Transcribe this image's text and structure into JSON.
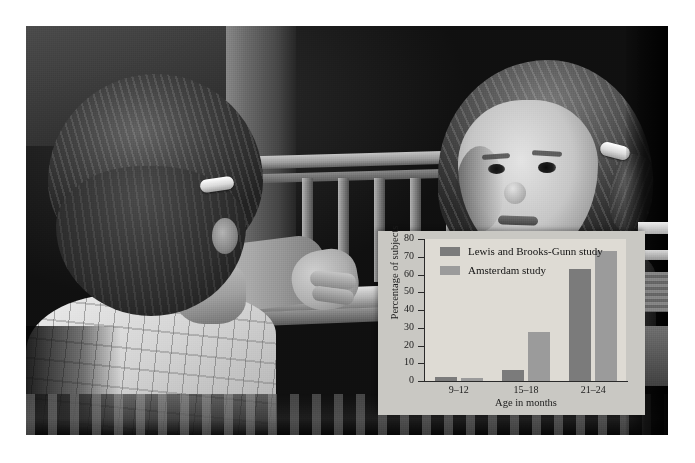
{
  "figure": {
    "background_color": "#ffffff",
    "photo": {
      "description": "black-and-white photograph of a toddler at a crib rail looking at her mirror reflection",
      "subjects": [
        {
          "name": "child-left",
          "detail": "back of head with white barrette, patterned sleeper, arm reaching toward mirror"
        },
        {
          "name": "child-right",
          "detail": "mirror reflection of toddler's face, ponytail with white barrette"
        }
      ]
    }
  },
  "chart_panel": {
    "panel_color": "#c9c8c3",
    "plot_color": "#dedbd4"
  },
  "chart_data": {
    "type": "bar",
    "title": "",
    "xlabel": "Age in months",
    "ylabel": "Percentage of subjects",
    "categories": [
      "9–12",
      "15–18",
      "21–24"
    ],
    "ylim": [
      0,
      80
    ],
    "yticks": [
      0,
      10,
      20,
      30,
      40,
      50,
      60,
      70,
      80
    ],
    "ytick_labels": [
      "0",
      "10",
      "20",
      "30",
      "40",
      "50",
      "60",
      "70",
      "80"
    ],
    "grid": false,
    "legend_position": "upper left",
    "series": [
      {
        "name": "Lewis and Brooks-Gunn study",
        "color": "#7b7b7b",
        "values": [
          2,
          6,
          63
        ]
      },
      {
        "name": "Amsterdam study",
        "color": "#9b9b9b",
        "values": [
          1.5,
          27.5,
          73
        ]
      }
    ]
  }
}
